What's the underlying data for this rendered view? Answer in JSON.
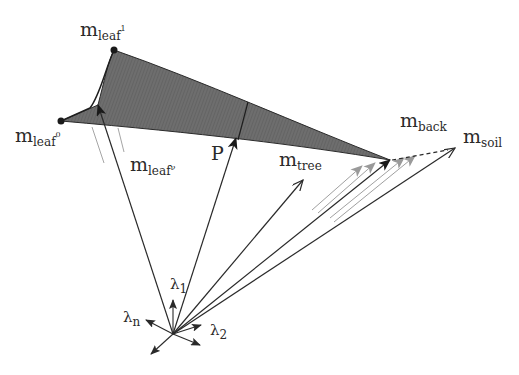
{
  "diagram": {
    "colors": {
      "triangle_fill": "#6b6b6b",
      "line": "#2a2a2a",
      "ghost": "#9a9a9a",
      "text": "#2a2a2a"
    },
    "labels": {
      "leaf1": {
        "base": "m",
        "sub": "leaf",
        "sup": "1"
      },
      "leaf0": {
        "base": "m",
        "sub": "leaf",
        "sup": "0"
      },
      "leafv": {
        "base": "m",
        "sub": "leaf",
        "sup": "ν"
      },
      "p": "P",
      "tree": {
        "base": "m",
        "sub": "tree"
      },
      "back": {
        "base": "m",
        "sub": "back"
      },
      "soil": {
        "base": "m",
        "sub": "soil"
      },
      "lambda1": {
        "base": "λ",
        "sub": "1"
      },
      "lambda2": {
        "base": "λ",
        "sub": "2"
      },
      "lambdan": {
        "base": "λ",
        "sub": "n"
      }
    },
    "points": {
      "origin": [
        173,
        334
      ],
      "leaf1": [
        114,
        50
      ],
      "leaf0": [
        61,
        121
      ],
      "leafv_tip": [
        98,
        105
      ],
      "p_tip": [
        236,
        138
      ],
      "tree_tip": [
        303,
        180
      ],
      "back_tip": [
        390,
        160
      ],
      "soil_tip": [
        455,
        148
      ]
    }
  }
}
